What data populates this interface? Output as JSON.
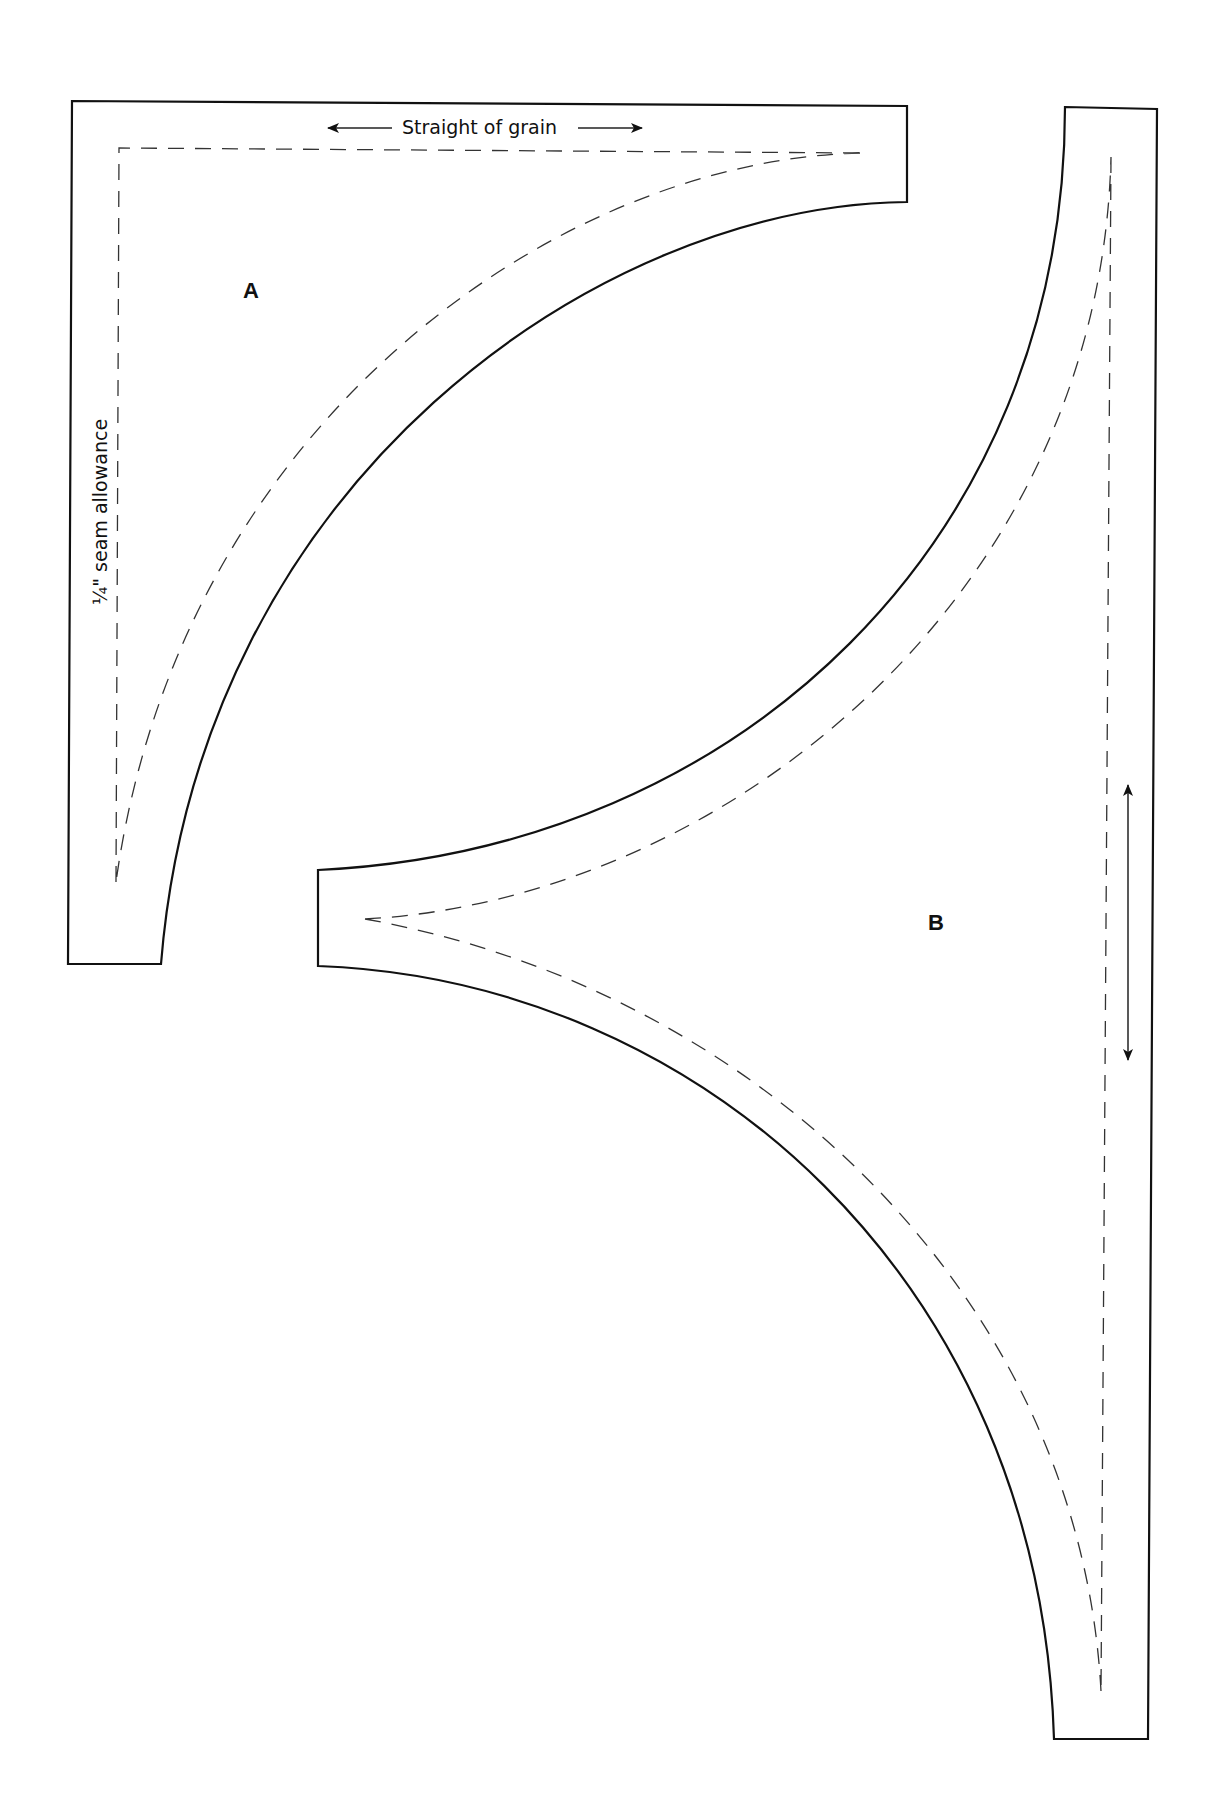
{
  "pieces": {
    "a": {
      "label": "A"
    },
    "b": {
      "label": "B"
    }
  },
  "annotations": {
    "grain_label": "Straight of grain",
    "seam_label": "¼\" seam allowance"
  },
  "colors": {
    "line": "#111111",
    "background": "#ffffff"
  }
}
